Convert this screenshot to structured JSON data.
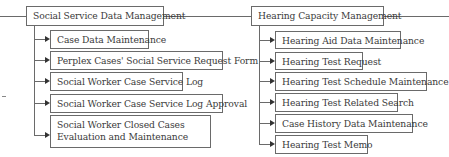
{
  "groups": [
    {
      "title": "Social Service Data Management",
      "items": [
        "Case Data Maintenance",
        "Perplex Cases' Social Service Request Form",
        "Social Worker Case Service Log",
        "Social Worker Case Service Log Approval",
        "Social Worker Closed Cases Evaluation and Maintenance"
      ]
    },
    {
      "title": "Hearing Capacity Management",
      "items": [
        "Hearing Aid Data Maintenance",
        "Hearing Test Request",
        "Hearing Test Schedule Maintenance",
        "Hearing Test Related Search",
        "Case History Data Maintenance",
        "Hearing Test Memo"
      ]
    }
  ]
}
